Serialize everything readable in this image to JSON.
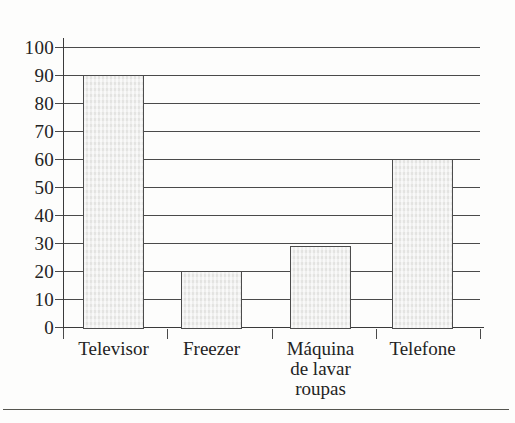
{
  "chart_data": {
    "type": "bar",
    "title": "",
    "subtitle": "",
    "xlabel": "",
    "ylabel": "",
    "categories": [
      "Televisor",
      "Freezer",
      "Máquina de lavar roupas",
      "Telefone"
    ],
    "values": [
      90,
      20,
      29,
      60
    ],
    "series": [
      {
        "name": "",
        "values": [
          90,
          20,
          29,
          60
        ]
      }
    ],
    "ylim": [
      0,
      100
    ],
    "ytick_step": 10,
    "ytick_labels": [
      "0",
      "10",
      "20",
      "30",
      "40",
      "50",
      "60",
      "70",
      "80",
      "90",
      "100"
    ],
    "grid": true,
    "grid_axis": "y",
    "legend": false,
    "legend_position": "none",
    "annotations": [],
    "bar_fill_color": "#e9e9e7",
    "bar_edge_color": "#4c4c4c",
    "grid_color": "#4a4a4a",
    "axis_color": "#3b3b3b",
    "text_color": "#232323",
    "background_color": "#fdfdfc"
  },
  "axis": {
    "y_ticks": [
      {
        "label": "100",
        "value": 100
      },
      {
        "label": "90",
        "value": 90
      },
      {
        "label": "80",
        "value": 80
      },
      {
        "label": "70",
        "value": 70
      },
      {
        "label": "60",
        "value": 60
      },
      {
        "label": "50",
        "value": 50
      },
      {
        "label": "40",
        "value": 40
      },
      {
        "label": "30",
        "value": 30
      },
      {
        "label": "20",
        "value": 20
      },
      {
        "label": "10",
        "value": 10
      },
      {
        "label": "0",
        "value": 0
      }
    ]
  },
  "bars": [
    {
      "label": "Televisor",
      "label_lines": "Televisor",
      "value": 90
    },
    {
      "label": "Freezer",
      "label_lines": "Freezer",
      "value": 20
    },
    {
      "label": "Máquina de lavar roupas",
      "label_lines": "Máquina\nde lavar\nroupas",
      "value": 29
    },
    {
      "label": "Telefone",
      "label_lines": "Telefone",
      "value": 60
    }
  ]
}
